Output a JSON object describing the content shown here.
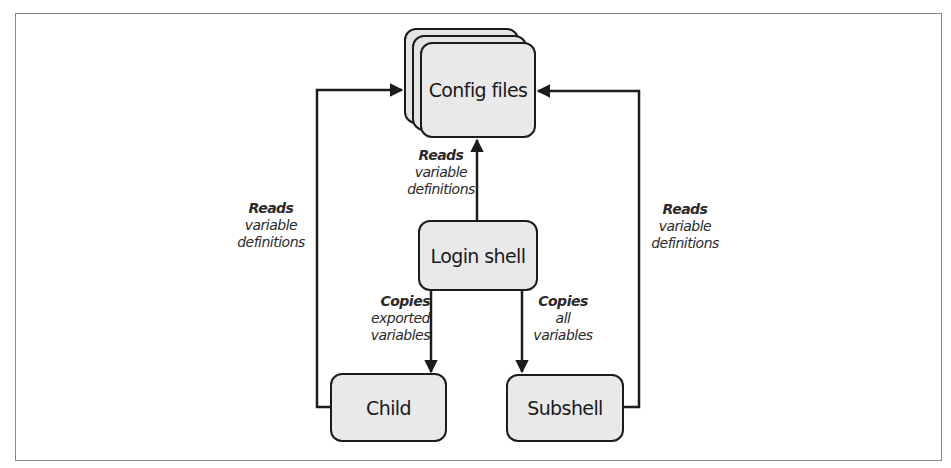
{
  "diagram": {
    "nodes": {
      "config_files": "Config files",
      "login_shell": "Login shell",
      "child": "Child",
      "subshell": "Subshell"
    },
    "edges": {
      "login_to_config": {
        "action": "Reads",
        "line1": "variable",
        "line2": "definitions"
      },
      "child_to_config": {
        "action": "Reads",
        "line1": "variable",
        "line2": "definitions"
      },
      "subshell_to_config": {
        "action": "Reads",
        "line1": "variable",
        "line2": "definitions"
      },
      "login_to_child": {
        "action": "Copies",
        "line1": "exported",
        "line2": "variables"
      },
      "login_to_subshell": {
        "action": "Copies",
        "line1": "all",
        "line2": "variables"
      }
    },
    "colors": {
      "box_fill": "#e9e9e9",
      "stroke": "#1c1c1c",
      "frame": "#8a8a8a"
    }
  }
}
